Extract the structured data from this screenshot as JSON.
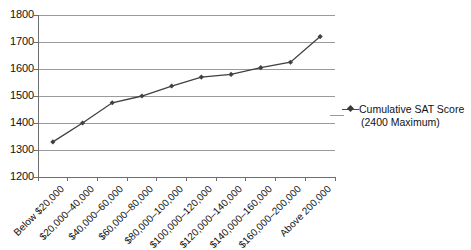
{
  "chart_data": {
    "type": "line",
    "title": "",
    "subtitle": "",
    "xlabel": "",
    "ylabel": "",
    "ylim": [
      1200,
      1800
    ],
    "y_ticks": [
      1200,
      1300,
      1400,
      1500,
      1600,
      1700,
      1800
    ],
    "grid": "horizontal",
    "legend_position": "right",
    "categories": [
      "Below $20,000",
      "$20,000–40,000",
      "$40,000–60,000",
      "$60,000–80,000",
      "$80,000–100,000",
      "$100,000–120,000",
      "$120,000–140,000",
      "$140,000–160,000",
      "$160,000–200,000",
      "Above 200,000"
    ],
    "series": [
      {
        "name": "Cumulative SAT Score (2400 Maximum)",
        "marker": "diamond",
        "color": "#404040",
        "values": [
          1330,
          1400,
          1475,
          1500,
          1537,
          1570,
          1580,
          1605,
          1625,
          1720
        ]
      }
    ],
    "legend": [
      {
        "line1": "Cumulative SAT Score",
        "line2": "(2400 Maximum)"
      }
    ]
  },
  "colors": {
    "series_line": "#4a4a4a",
    "gridline": "#9a9a9a",
    "axis": "#6e6e6e",
    "text": "#111111",
    "background": "#ffffff"
  }
}
